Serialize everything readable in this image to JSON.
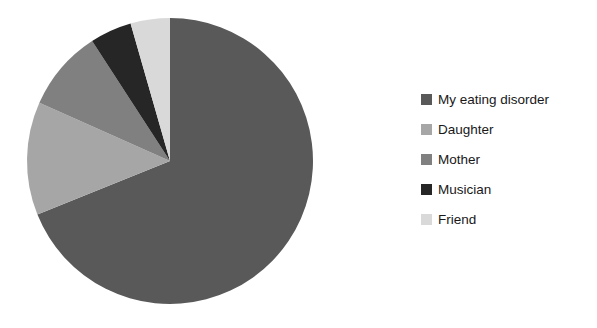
{
  "chart_data": {
    "type": "pie",
    "title": "",
    "subtitle": "",
    "xlabel": "",
    "ylabel": "",
    "grid": false,
    "legend_position": "right",
    "start_angle_deg": 0,
    "direction": "clockwise",
    "center": {
      "x": 170,
      "y": 161
    },
    "radius": 143,
    "categories": [
      "My eating disorder",
      "Daughter",
      "Mother",
      "Musician",
      "Friend"
    ],
    "values": [
      68.9,
      12.8,
      9.2,
      4.7,
      4.4
    ],
    "slice_angles_deg": [
      248,
      46,
      33,
      17,
      16
    ],
    "colors": [
      "#595959",
      "#a6a6a6",
      "#808080",
      "#262626",
      "#d9d9d9"
    ],
    "slices": [
      {
        "label": "My eating disorder",
        "value": 68.9,
        "angle_deg": 248,
        "color": "#595959",
        "start_deg": 0,
        "end_deg": 248
      },
      {
        "label": "Daughter",
        "value": 12.8,
        "angle_deg": 46,
        "color": "#a6a6a6",
        "start_deg": 248,
        "end_deg": 294
      },
      {
        "label": "Mother",
        "value": 9.2,
        "angle_deg": 33,
        "color": "#808080",
        "start_deg": 294,
        "end_deg": 327
      },
      {
        "label": "Musician",
        "value": 4.7,
        "angle_deg": 17,
        "color": "#262626",
        "start_deg": 327,
        "end_deg": 344
      },
      {
        "label": "Friend",
        "value": 4.4,
        "angle_deg": 16,
        "color": "#d9d9d9",
        "start_deg": 344,
        "end_deg": 360
      }
    ]
  },
  "legend": {
    "items": [
      {
        "label": "My eating disorder",
        "color": "#595959"
      },
      {
        "label": "Daughter",
        "color": "#a6a6a6"
      },
      {
        "label": "Mother",
        "color": "#808080"
      },
      {
        "label": "Musician",
        "color": "#262626"
      },
      {
        "label": "Friend",
        "color": "#d9d9d9"
      }
    ]
  },
  "canvas": {
    "background": "#ffffff",
    "width": 597,
    "height": 328
  }
}
